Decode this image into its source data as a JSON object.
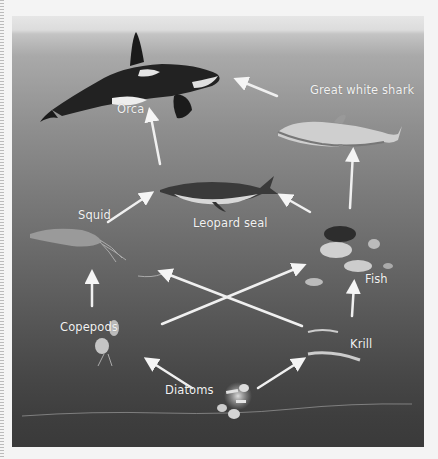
{
  "diagram": {
    "title": "",
    "type": "food-web",
    "background": {
      "surface_color": "#dcdcdc",
      "deep_color": "#3a3a3a"
    },
    "organisms": [
      {
        "id": "orca",
        "label": "Orca"
      },
      {
        "id": "great-white-shark",
        "label": "Great white shark"
      },
      {
        "id": "leopard-seal",
        "label": "Leopard seal"
      },
      {
        "id": "squid",
        "label": "Squid"
      },
      {
        "id": "fish",
        "label": "Fish"
      },
      {
        "id": "copepods",
        "label": "Copepods"
      },
      {
        "id": "krill",
        "label": "Krill"
      },
      {
        "id": "diatoms",
        "label": "Diatoms"
      }
    ],
    "arrows": [
      {
        "from": "Leopard seal",
        "to": "Orca"
      },
      {
        "from": "Great white shark",
        "to": "Orca"
      },
      {
        "from": "Fish",
        "to": "Great white shark"
      },
      {
        "from": "Squid",
        "to": "Leopard seal"
      },
      {
        "from": "Fish",
        "to": "Leopard seal"
      },
      {
        "from": "Copepods",
        "to": "Squid"
      },
      {
        "from": "Krill",
        "to": "Squid"
      },
      {
        "from": "Copepods",
        "to": "Fish"
      },
      {
        "from": "Krill",
        "to": "Fish"
      },
      {
        "from": "Diatoms",
        "to": "Copepods"
      },
      {
        "from": "Diatoms",
        "to": "Krill"
      }
    ]
  }
}
